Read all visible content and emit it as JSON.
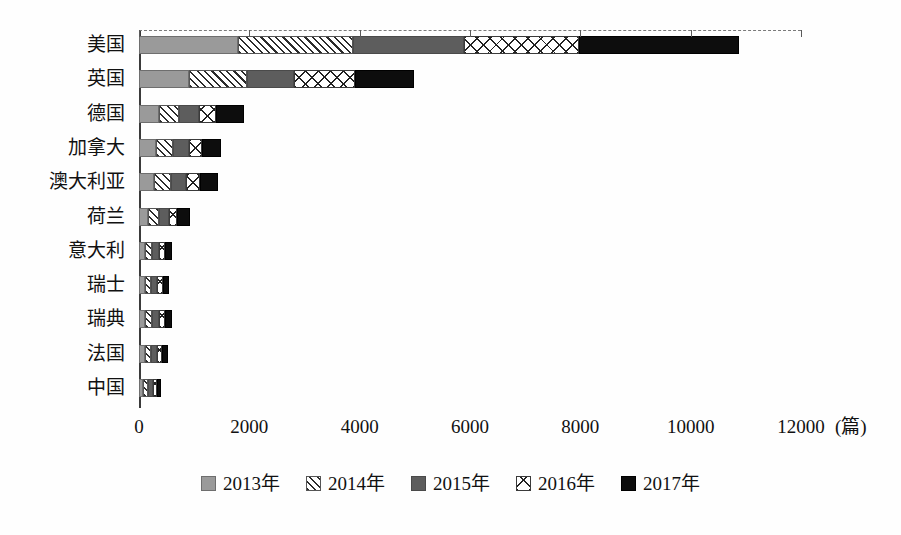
{
  "chart_data": {
    "type": "bar",
    "orientation": "horizontal",
    "stacked": true,
    "title": "",
    "xlabel": "",
    "ylabel": "",
    "unit_label": "(篇)",
    "xlim": [
      0,
      12000
    ],
    "xticks": [
      0,
      2000,
      4000,
      6000,
      8000,
      10000,
      12000
    ],
    "xtick_labels": [
      "0",
      "2000",
      "4000",
      "6000",
      "8000",
      "10000",
      "12000"
    ],
    "grid": false,
    "legend_position": "bottom",
    "categories": [
      "美国",
      "英国",
      "德国",
      "加拿大",
      "澳大利亚",
      "荷兰",
      "意大利",
      "瑞士",
      "瑞典",
      "法国",
      "中国"
    ],
    "series": [
      {
        "name": "2013年",
        "color": "#9a9a9a",
        "pattern": "solid-gray",
        "values": [
          1800,
          900,
          360,
          300,
          280,
          170,
          110,
          100,
          110,
          100,
          80
        ]
      },
      {
        "name": "2014年",
        "color": "#2b2b2b",
        "pattern": "diagonal-hatch",
        "values": [
          2080,
          1050,
          370,
          320,
          300,
          190,
          130,
          120,
          130,
          120,
          90
        ]
      },
      {
        "name": "2015年",
        "color": "#5d5d5d",
        "pattern": "solid-dark-gray",
        "values": [
          2020,
          860,
          350,
          290,
          280,
          180,
          130,
          110,
          120,
          110,
          90
        ]
      },
      {
        "name": "2016年",
        "color": "#ffffff",
        "pattern": "diamond-cross",
        "values": [
          2080,
          1100,
          310,
          230,
          240,
          140,
          100,
          100,
          110,
          90,
          70
        ]
      },
      {
        "name": "2017年",
        "color": "#0d0d0d",
        "pattern": "solid-black",
        "values": [
          2900,
          1070,
          510,
          340,
          340,
          240,
          120,
          110,
          120,
          110,
          60
        ]
      }
    ],
    "totals": [
      10880,
      4980,
      1900,
      1480,
      1440,
      920,
      590,
      540,
      590,
      530,
      390
    ]
  }
}
